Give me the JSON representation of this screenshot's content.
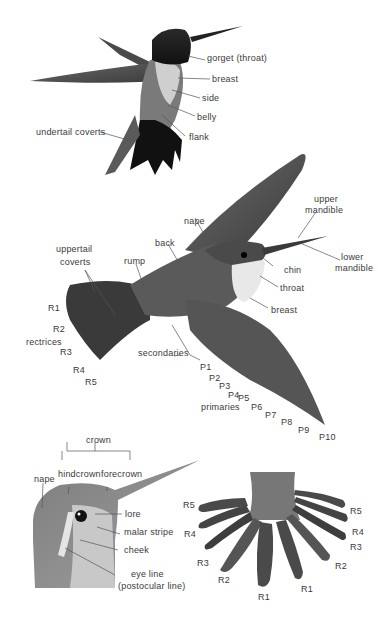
{
  "diagram": {
    "panels": [
      {
        "name": "hovering-bird-underside",
        "labels": [
          "gorget (throat)",
          "breast",
          "side",
          "belly",
          "flank",
          "undertail coverts"
        ]
      },
      {
        "name": "flying-bird-topside",
        "labels": {
          "upper_mandible": [
            "upper",
            "mandible"
          ],
          "lower_mandible": [
            "lower",
            "mandible"
          ],
          "nape": "nape",
          "back": "back",
          "rump": "rump",
          "uppertail_coverts": [
            "uppertail",
            "coverts"
          ],
          "chin": "chin",
          "throat": "throat",
          "breast": "breast",
          "rectrices": "rectrices",
          "rectrix_numbers": [
            "R1",
            "R2",
            "R3",
            "R4",
            "R5"
          ],
          "secondaries": "secondaries",
          "primaries": "primaries",
          "primary_numbers": [
            "P1",
            "P2",
            "P3",
            "P4",
            "P5",
            "P6",
            "P7",
            "P8",
            "P9",
            "P10"
          ]
        }
      },
      {
        "name": "head-detail",
        "labels": {
          "crown": "crown",
          "hindcrown": "hindcrown",
          "forecrown": "forecrown",
          "nape": "nape",
          "lore": "lore",
          "malar_stripe": "malar stripe",
          "cheek": "cheek",
          "eye_line": [
            "eye line",
            "(postocular line)"
          ]
        }
      },
      {
        "name": "tail-spread",
        "labels": {
          "left": [
            "R5",
            "R4",
            "R3",
            "R2",
            "R1"
          ],
          "right": [
            "R5",
            "R4",
            "R3",
            "R2",
            "R1"
          ]
        }
      }
    ]
  }
}
